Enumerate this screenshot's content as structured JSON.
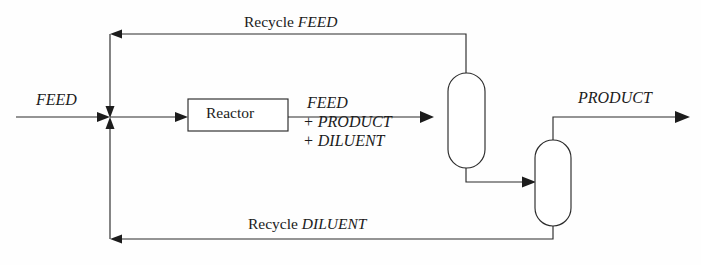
{
  "diagram": {
    "background_color": "#fefefe",
    "line_color": "#2b2b2b",
    "units": [
      {
        "name": "reactor",
        "label": "Reactor",
        "shape": "rectangle"
      },
      {
        "name": "column-1",
        "label": "",
        "shape": "capsule"
      },
      {
        "name": "column-2",
        "label": "",
        "shape": "capsule"
      }
    ],
    "labels": {
      "feed_in": "FEED",
      "reactor": "Reactor",
      "recycle_feed_prefix": "Recycle",
      "recycle_feed_stream": "FEED",
      "recycle_diluent_prefix": "Recycle",
      "recycle_diluent_stream": "DILUENT",
      "product_out": "PRODUCT",
      "reactor_outlet_line1": "FEED",
      "reactor_outlet_line2": "+ PRODUCT",
      "reactor_outlet_line3": "+ DILUENT"
    },
    "streams": [
      {
        "name": "feed-inlet",
        "from": "boundary-left",
        "to": "mixing-junction",
        "label": "FEED"
      },
      {
        "name": "junction-to-reactor",
        "from": "mixing-junction",
        "to": "reactor",
        "label": ""
      },
      {
        "name": "reactor-effluent",
        "from": "reactor",
        "to": "column-1",
        "label": "FEED + PRODUCT + DILUENT"
      },
      {
        "name": "column1-overhead-recycle",
        "from": "column-1",
        "to": "mixing-junction",
        "label": "Recycle FEED"
      },
      {
        "name": "column1-bottoms",
        "from": "column-1",
        "to": "column-2",
        "label": ""
      },
      {
        "name": "column2-overhead-product",
        "from": "column-2",
        "to": "boundary-right",
        "label": "PRODUCT"
      },
      {
        "name": "column2-bottoms-recycle",
        "from": "column-2",
        "to": "mixing-junction",
        "label": "Recycle DILUENT"
      }
    ]
  }
}
